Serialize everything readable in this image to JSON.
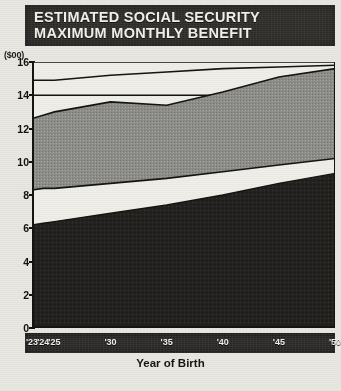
{
  "title": {
    "line1": "ESTIMATED SOCIAL SECURITY",
    "line2": "MAXIMUM MONTHLY BENEFIT"
  },
  "colors": {
    "title_bg": "#2e2c29",
    "title_text": "#f2f0ec",
    "band_lower": "#232220",
    "band_middle": "#f4f2ee",
    "band_upper": "#8d8d8a",
    "axis_line": "#15140f",
    "page_bg": "#e9e7e2",
    "xaxis_strip": "#2b2927"
  },
  "chart_data": {
    "type": "area",
    "title": "ESTIMATED SOCIAL SECURITY MAXIMUM MONTHLY BENEFIT",
    "xlabel": "Year of Birth",
    "ylabel": "($00)",
    "ylim": [
      0,
      16
    ],
    "yticks": [
      0,
      2,
      4,
      6,
      8,
      10,
      12,
      14,
      16
    ],
    "ytick_labels": [
      "0",
      "2",
      "4",
      "6",
      "8",
      "10",
      "12",
      "14",
      "16"
    ],
    "grid": true,
    "gridlines": [
      14,
      16
    ],
    "legend": "none",
    "x": [
      23,
      24,
      25,
      30,
      35,
      40,
      45,
      50
    ],
    "xtick_labels": [
      "'23",
      "'24",
      "'25",
      "'30",
      "'35",
      "'40",
      "'45",
      "'50"
    ],
    "series": [
      {
        "name": "Lower band top",
        "values": [
          6.2,
          6.3,
          6.4,
          6.9,
          7.4,
          8.0,
          8.7,
          9.3
        ]
      },
      {
        "name": "Middle gap band top",
        "values": [
          8.3,
          8.4,
          8.4,
          8.7,
          9.0,
          9.4,
          9.8,
          10.2
        ]
      },
      {
        "name": "Upper band top",
        "values": [
          12.6,
          12.8,
          13.0,
          13.6,
          13.4,
          14.2,
          15.1,
          15.6
        ]
      },
      {
        "name": "Boundary line",
        "values": [
          14.9,
          14.9,
          14.9,
          15.2,
          15.4,
          15.6,
          15.7,
          15.8
        ]
      }
    ],
    "annotations": []
  },
  "axis": {
    "unit": "($00)",
    "xlabel": "Year of Birth"
  }
}
